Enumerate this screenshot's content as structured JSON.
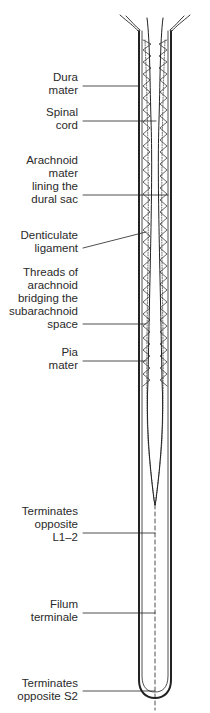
{
  "diagram": {
    "labels": [
      {
        "id": "dura-mater",
        "text": "Dura\nmater",
        "top": 71
      },
      {
        "id": "spinal-cord",
        "text": "Spinal\ncord",
        "top": 117
      },
      {
        "id": "arachnoid-mater",
        "text": "Arachnoid\nmater\nlining the\ndural sac",
        "top": 163
      },
      {
        "id": "denticulate-ligament",
        "text": "Denticulate\nligament",
        "top": 234
      },
      {
        "id": "arachnoid-threads",
        "text": "Threads of\narachnoid\nbridging the\nsubarachnoid\nspace",
        "top": 271
      },
      {
        "id": "pia-mater",
        "text": "Pia\nmater",
        "top": 344
      },
      {
        "id": "cord-termination",
        "text": "Terminates\nopposite\nL1–2",
        "top": 503
      },
      {
        "id": "filum-terminale",
        "text": "Filum\nterminale",
        "top": 594
      },
      {
        "id": "sac-termination",
        "text": "Terminates\nopposite S2",
        "top": 675
      }
    ],
    "colors": {
      "line": "#222222",
      "background": "#ffffff"
    }
  }
}
